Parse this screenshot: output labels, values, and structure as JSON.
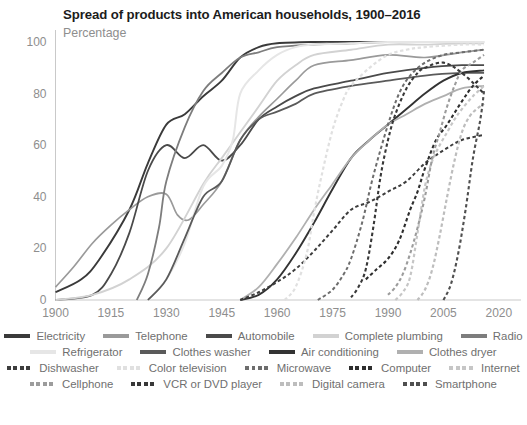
{
  "header": {
    "title": "Spread of products into American households, 1900–2016",
    "subtitle": "Percentage"
  },
  "chart_data": {
    "type": "line",
    "title": "Spread of products into American households, 1900–2016",
    "subtitle": "Percentage",
    "xlabel": "",
    "ylabel": "Percentage",
    "xlim": [
      1900,
      2026
    ],
    "ylim": [
      0,
      100
    ],
    "xticks": [
      1900,
      1915,
      1930,
      1945,
      1960,
      1975,
      1990,
      2005,
      2020
    ],
    "yticks": [
      0,
      20,
      40,
      60,
      80,
      100
    ],
    "grid": false,
    "legend_position": "bottom",
    "series": [
      {
        "name": "Electricity",
        "color": "#3a3a3a",
        "dash": "solid",
        "width": 1.9,
        "x": [
          1900,
          1907,
          1912,
          1920,
          1925,
          1930,
          1935,
          1940,
          1945,
          1950,
          1955,
          1960,
          1970,
          1980,
          1990,
          2000,
          2016
        ],
        "y": [
          3,
          8,
          16,
          35,
          53,
          68,
          72,
          79,
          85,
          94,
          98,
          99.5,
          100,
          100,
          100,
          100,
          100
        ]
      },
      {
        "name": "Telephone",
        "color": "#9a9a9a",
        "dash": "solid",
        "width": 1.7,
        "x": [
          1900,
          1905,
          1910,
          1915,
          1920,
          1925,
          1930,
          1933,
          1936,
          1940,
          1945,
          1950,
          1955,
          1960,
          1965,
          1970,
          1980,
          1990,
          2000,
          2010,
          2016
        ],
        "y": [
          5,
          13,
          22,
          29,
          35,
          40,
          41,
          33,
          31,
          37,
          46,
          62,
          71,
          78,
          85,
          91,
          93,
          95,
          94,
          96,
          97
        ]
      },
      {
        "name": "Automobile",
        "color": "#4a4a4a",
        "dash": "solid",
        "width": 1.8,
        "x": [
          1900,
          1910,
          1915,
          1920,
          1925,
          1930,
          1935,
          1940,
          1945,
          1950,
          1955,
          1960,
          1965,
          1970,
          1980,
          1990,
          2000,
          2010,
          2016
        ],
        "y": [
          0,
          2,
          10,
          26,
          50,
          60,
          55,
          60,
          54,
          60,
          70,
          75,
          79,
          82,
          85,
          88,
          90,
          91,
          91
        ]
      },
      {
        "name": "Complete plumbing",
        "color": "#d2d2d2",
        "dash": "solid",
        "width": 1.9,
        "x": [
          1900,
          1910,
          1920,
          1930,
          1940,
          1945,
          1950,
          1955,
          1960,
          1965,
          1970,
          1980,
          1990,
          2000,
          2010,
          2016
        ],
        "y": [
          0,
          2,
          8,
          20,
          45,
          55,
          65,
          75,
          85,
          91,
          95,
          97,
          99,
          99,
          99.5,
          99.5
        ]
      },
      {
        "name": "Radio",
        "color": "#7d7d7d",
        "dash": "solid",
        "width": 1.8,
        "x": [
          1922,
          1925,
          1928,
          1930,
          1935,
          1940,
          1945,
          1950,
          1955,
          1960,
          1970,
          1980,
          1990,
          2000,
          2016
        ],
        "y": [
          0,
          10,
          28,
          46,
          67,
          81,
          88,
          94,
          96,
          98,
          99,
          99.5,
          100,
          100,
          100
        ]
      },
      {
        "name": "Refrigerator",
        "color": "#e6e6e6",
        "dash": "solid",
        "width": 2.0,
        "x": [
          1925,
          1930,
          1935,
          1940,
          1945,
          1948,
          1950,
          1955,
          1960,
          1965,
          1970,
          1980,
          1990,
          2000,
          2016
        ],
        "y": [
          0,
          8,
          22,
          44,
          52,
          62,
          80,
          89,
          95,
          98,
          99,
          99.5,
          100,
          100,
          100
        ]
      },
      {
        "name": "Clothes washer",
        "color": "#5a5a5a",
        "dash": "solid",
        "width": 1.8,
        "x": [
          1925,
          1930,
          1935,
          1940,
          1945,
          1950,
          1955,
          1960,
          1965,
          1970,
          1980,
          1990,
          2000,
          2010,
          2016
        ],
        "y": [
          0,
          8,
          24,
          40,
          46,
          62,
          70,
          73,
          76,
          80,
          83,
          85,
          87,
          88,
          88
        ]
      },
      {
        "name": "Air conditioning",
        "color": "#333333",
        "dash": "solid",
        "width": 1.9,
        "x": [
          1950,
          1955,
          1960,
          1965,
          1970,
          1975,
          1980,
          1985,
          1990,
          1995,
          2000,
          2005,
          2010,
          2016
        ],
        "y": [
          0,
          2,
          8,
          18,
          30,
          43,
          55,
          62,
          68,
          74,
          80,
          85,
          88,
          89
        ]
      },
      {
        "name": "Clothes dryer",
        "color": "#b0b0b0",
        "dash": "solid",
        "width": 1.8,
        "x": [
          1950,
          1955,
          1960,
          1965,
          1970,
          1975,
          1980,
          1985,
          1990,
          1995,
          2000,
          2005,
          2010,
          2016
        ],
        "y": [
          0,
          5,
          14,
          24,
          35,
          45,
          55,
          62,
          68,
          72,
          76,
          79,
          82,
          83
        ]
      },
      {
        "name": "Dishwasher",
        "color": "#3d3d3d",
        "dash": "dashed",
        "width": 2.0,
        "x": [
          1950,
          1955,
          1960,
          1965,
          1970,
          1975,
          1980,
          1985,
          1990,
          1995,
          2000,
          2005,
          2010,
          2016
        ],
        "y": [
          0,
          3,
          7,
          12,
          19,
          27,
          35,
          38,
          42,
          46,
          53,
          58,
          62,
          64
        ]
      },
      {
        "name": "Color television",
        "color": "#e0e0e0",
        "dash": "dashed",
        "width": 2.2,
        "x": [
          1962,
          1965,
          1968,
          1970,
          1972,
          1975,
          1978,
          1980,
          1985,
          1990,
          1995,
          2000,
          2010,
          2016
        ],
        "y": [
          0,
          5,
          18,
          34,
          48,
          66,
          78,
          83,
          90,
          95,
          97,
          98,
          99,
          99
        ]
      },
      {
        "name": "Microwave",
        "color": "#6d6d6d",
        "dash": "dashed",
        "width": 2.0,
        "x": [
          1971,
          1975,
          1978,
          1980,
          1983,
          1986,
          1990,
          1993,
          1996,
          2000,
          2005,
          2010,
          2016
        ],
        "y": [
          0,
          4,
          10,
          16,
          30,
          48,
          68,
          80,
          87,
          92,
          95,
          96,
          97
        ]
      },
      {
        "name": "Computer",
        "color": "#2e2e2e",
        "dash": "dashed",
        "width": 2.1,
        "x": [
          1984,
          1987,
          1990,
          1993,
          1996,
          1998,
          2000,
          2003,
          2006,
          2010,
          2013,
          2016
        ],
        "y": [
          8,
          12,
          16,
          23,
          35,
          42,
          51,
          62,
          68,
          77,
          83,
          87
        ]
      },
      {
        "name": "Internet",
        "color": "#c6c6c6",
        "dash": "dashed",
        "width": 2.2,
        "x": [
          1992,
          1994,
          1996,
          1998,
          2000,
          2002,
          2004,
          2006,
          2008,
          2010,
          2013,
          2016
        ],
        "y": [
          0,
          3,
          9,
          26,
          44,
          54,
          60,
          65,
          70,
          74,
          79,
          83
        ]
      },
      {
        "name": "Cellphone",
        "color": "#9c9c9c",
        "dash": "dashed",
        "width": 2.1,
        "x": [
          1990,
          1992,
          1994,
          1996,
          1998,
          2000,
          2002,
          2004,
          2006,
          2008,
          2010,
          2013,
          2016
        ],
        "y": [
          2,
          5,
          10,
          18,
          28,
          40,
          55,
          65,
          75,
          83,
          89,
          92,
          95
        ]
      },
      {
        "name": "VCR or DVD player",
        "color": "#383838",
        "dash": "dashed",
        "width": 2.1,
        "x": [
          1980,
          1982,
          1984,
          1986,
          1988,
          1990,
          1992,
          1995,
          1998,
          2000,
          2005,
          2010,
          2016
        ],
        "y": [
          1,
          5,
          12,
          28,
          48,
          62,
          72,
          82,
          88,
          90,
          92,
          88,
          80
        ]
      },
      {
        "name": "Digital camera",
        "color": "#bdbdbd",
        "dash": "dashed",
        "width": 2.2,
        "x": [
          1998,
          2000,
          2002,
          2004,
          2006,
          2008,
          2010,
          2012,
          2014,
          2016
        ],
        "y": [
          0,
          4,
          12,
          25,
          40,
          54,
          65,
          71,
          74,
          76
        ]
      },
      {
        "name": "Smartphone",
        "color": "#4f4f4f",
        "dash": "dashed",
        "width": 2.1,
        "x": [
          2005,
          2007,
          2009,
          2011,
          2013,
          2015,
          2016
        ],
        "y": [
          0,
          6,
          18,
          35,
          55,
          70,
          81
        ]
      }
    ]
  },
  "legend": {
    "rows": [
      [
        "Electricity",
        "Telephone",
        "Automobile",
        "Complete plumbing",
        "Radio"
      ],
      [
        "Refrigerator",
        "Clothes washer",
        "Air conditioning",
        "Clothes dryer"
      ],
      [
        "Dishwasher",
        "Color television",
        "Microwave",
        "Computer",
        "Internet"
      ],
      [
        "Cellphone",
        "VCR or DVD player",
        "Digital camera",
        "Smartphone"
      ]
    ]
  }
}
